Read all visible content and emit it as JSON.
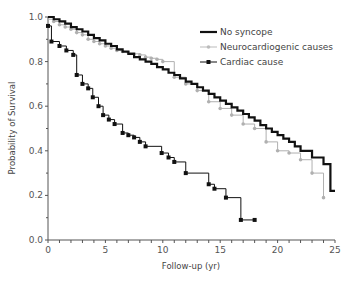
{
  "chart_data": {
    "type": "line",
    "subtype": "kaplan-meier-step",
    "title": "",
    "xlabel": "Follow-up (yr)",
    "ylabel": "Probability of Survival",
    "xlim": [
      0,
      25
    ],
    "ylim": [
      0,
      1.0
    ],
    "xticks": [
      0,
      5,
      10,
      15,
      20,
      25
    ],
    "xtick_labels": [
      "0",
      "5",
      "10",
      "15",
      "20",
      "25"
    ],
    "yticks": [
      0.0,
      0.2,
      0.4,
      0.6,
      0.8,
      1.0
    ],
    "ytick_labels": [
      "0.0",
      "0.2",
      "0.4",
      "0.6",
      "0.8",
      "1.0"
    ],
    "grid": false,
    "legend_position": "upper right",
    "series": [
      {
        "name": "No syncope",
        "color": "#111111",
        "line_width": 2.2,
        "marker": "none",
        "x": [
          0,
          0.5,
          1,
          1.5,
          2,
          2.5,
          3,
          3.5,
          4,
          4.5,
          5,
          5.5,
          6,
          6.5,
          7,
          7.5,
          8,
          8.5,
          9,
          9.5,
          10,
          10.5,
          11,
          11.5,
          12,
          12.5,
          13,
          13.5,
          14,
          14.5,
          15,
          15.5,
          16,
          16.5,
          17,
          17.5,
          18,
          18.5,
          19,
          19.5,
          20,
          20.5,
          21,
          21.5,
          22,
          23,
          24,
          24.6,
          25
        ],
        "y": [
          1.0,
          0.99,
          0.98,
          0.97,
          0.955,
          0.945,
          0.935,
          0.92,
          0.905,
          0.895,
          0.88,
          0.87,
          0.855,
          0.845,
          0.835,
          0.82,
          0.81,
          0.8,
          0.79,
          0.775,
          0.765,
          0.75,
          0.74,
          0.725,
          0.71,
          0.7,
          0.685,
          0.67,
          0.655,
          0.64,
          0.625,
          0.61,
          0.595,
          0.58,
          0.565,
          0.55,
          0.535,
          0.515,
          0.5,
          0.485,
          0.47,
          0.455,
          0.44,
          0.42,
          0.4,
          0.37,
          0.34,
          0.22,
          0.22
        ]
      },
      {
        "name": "Neurocardiogenic causes",
        "color": "#b0b0b0",
        "line_width": 1,
        "marker": "circle",
        "x": [
          0,
          0.5,
          1,
          1.5,
          2,
          2.5,
          3,
          3.5,
          4,
          4.5,
          5,
          5.5,
          6,
          6.5,
          7,
          7.5,
          8,
          8.5,
          9,
          9.5,
          10,
          11,
          12,
          13,
          14,
          15,
          16,
          17,
          18,
          19,
          20,
          21,
          22,
          23,
          24
        ],
        "y": [
          0.99,
          0.98,
          0.965,
          0.955,
          0.945,
          0.93,
          0.92,
          0.9,
          0.89,
          0.88,
          0.87,
          0.86,
          0.85,
          0.845,
          0.84,
          0.835,
          0.83,
          0.82,
          0.815,
          0.81,
          0.8,
          0.73,
          0.7,
          0.67,
          0.62,
          0.59,
          0.56,
          0.52,
          0.5,
          0.44,
          0.4,
          0.39,
          0.36,
          0.3,
          0.19
        ]
      },
      {
        "name": "Cardiac cause",
        "color": "#111111",
        "line_width": 1,
        "marker": "square",
        "x": [
          0,
          0.3,
          1.0,
          1.6,
          2.2,
          2.5,
          3.0,
          3.5,
          3.9,
          4.4,
          4.8,
          5.3,
          5.8,
          6.5,
          7.0,
          7.5,
          8.0,
          8.5,
          9.9,
          10.5,
          11.0,
          12.0,
          14.0,
          14.5,
          15.5,
          16.8,
          18.0
        ],
        "y": [
          0.96,
          0.89,
          0.87,
          0.85,
          0.83,
          0.74,
          0.7,
          0.68,
          0.64,
          0.6,
          0.56,
          0.54,
          0.52,
          0.48,
          0.47,
          0.46,
          0.44,
          0.42,
          0.39,
          0.37,
          0.35,
          0.3,
          0.25,
          0.23,
          0.19,
          0.09,
          0.09
        ]
      }
    ]
  },
  "legend": {
    "items": [
      {
        "label": "No syncope"
      },
      {
        "label": "Neurocardiogenic causes"
      },
      {
        "label": "Cardiac cause"
      }
    ]
  },
  "axes": {
    "xlabel": "Follow-up (yr)",
    "ylabel": "Probability of Survival"
  }
}
